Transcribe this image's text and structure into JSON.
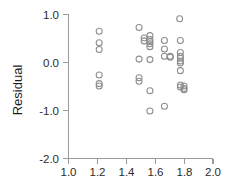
{
  "chart_data": {
    "type": "scatter",
    "title": "",
    "xlabel": "",
    "ylabel": "Residual",
    "xlim": [
      1.0,
      2.0
    ],
    "ylim": [
      -2.0,
      1.0
    ],
    "xticks": [
      1.0,
      1.2,
      1.4,
      1.6,
      1.8,
      2.0
    ],
    "xticklabels": [
      "1.0",
      "1.2",
      "1.4",
      "1.6",
      "1.8",
      "2.0"
    ],
    "yticks": [
      1.0,
      0.0,
      -1.0,
      -2.0
    ],
    "yticklabels": [
      "1.0",
      "0.0",
      "-1.0",
      "-2.0"
    ],
    "grid": false,
    "legend": null,
    "marker": "open-circle",
    "marker_color": "#8d8d8d",
    "n_points": 39,
    "points": [
      {
        "x": 1.215,
        "y": 0.64
      },
      {
        "x": 1.215,
        "y": 0.4
      },
      {
        "x": 1.215,
        "y": 0.26
      },
      {
        "x": 1.215,
        "y": -0.27
      },
      {
        "x": 1.215,
        "y": -0.45
      },
      {
        "x": 1.215,
        "y": -0.5
      },
      {
        "x": 1.49,
        "y": 0.72
      },
      {
        "x": 1.49,
        "y": 0.06
      },
      {
        "x": 1.49,
        "y": -0.33
      },
      {
        "x": 1.49,
        "y": -0.4
      },
      {
        "x": 1.565,
        "y": 0.55
      },
      {
        "x": 1.565,
        "y": 0.47
      },
      {
        "x": 1.565,
        "y": 0.42
      },
      {
        "x": 1.565,
        "y": 0.38
      },
      {
        "x": 1.565,
        "y": 0.32
      },
      {
        "x": 1.565,
        "y": 0.05
      },
      {
        "x": 1.565,
        "y": -0.6
      },
      {
        "x": 1.565,
        "y": -1.02
      },
      {
        "x": 1.665,
        "y": 0.45
      },
      {
        "x": 1.665,
        "y": 0.27
      },
      {
        "x": 1.665,
        "y": 0.12
      },
      {
        "x": 1.665,
        "y": -0.92
      },
      {
        "x": 1.77,
        "y": 0.9
      },
      {
        "x": 1.775,
        "y": 0.45
      },
      {
        "x": 1.775,
        "y": 0.2
      },
      {
        "x": 1.775,
        "y": 0.12
      },
      {
        "x": 1.775,
        "y": 0.08
      },
      {
        "x": 1.775,
        "y": 0.02
      },
      {
        "x": 1.775,
        "y": -0.02
      },
      {
        "x": 1.775,
        "y": -0.18
      },
      {
        "x": 1.775,
        "y": -0.48
      },
      {
        "x": 1.775,
        "y": -0.52
      },
      {
        "x": 1.8,
        "y": -0.5
      },
      {
        "x": 1.8,
        "y": -0.55
      },
      {
        "x": 1.8,
        "y": -0.58
      },
      {
        "x": 1.705,
        "y": 0.12
      },
      {
        "x": 1.705,
        "y": 0.1
      },
      {
        "x": 1.525,
        "y": 0.5
      },
      {
        "x": 1.525,
        "y": 0.44
      }
    ]
  },
  "axes": {
    "y_label": "Residual"
  }
}
